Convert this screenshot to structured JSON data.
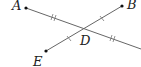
{
  "diagram": {
    "points": [
      {
        "name": "A",
        "x": 26,
        "y": 8
      },
      {
        "name": "B",
        "x": 122,
        "y": 6
      },
      {
        "name": "E",
        "x": 46,
        "y": 51
      },
      {
        "name": "D",
        "x": 84,
        "y": 28
      }
    ],
    "labels": {
      "A": "A",
      "B": "B",
      "D": "D",
      "E": "E"
    },
    "segments": [
      {
        "from": "A",
        "to": "right-edge",
        "ticks": "double on AD and beyond D"
      },
      {
        "from": "E",
        "to": "B",
        "ticks": "single on ED and DB"
      }
    ],
    "line_color": "#555555"
  }
}
